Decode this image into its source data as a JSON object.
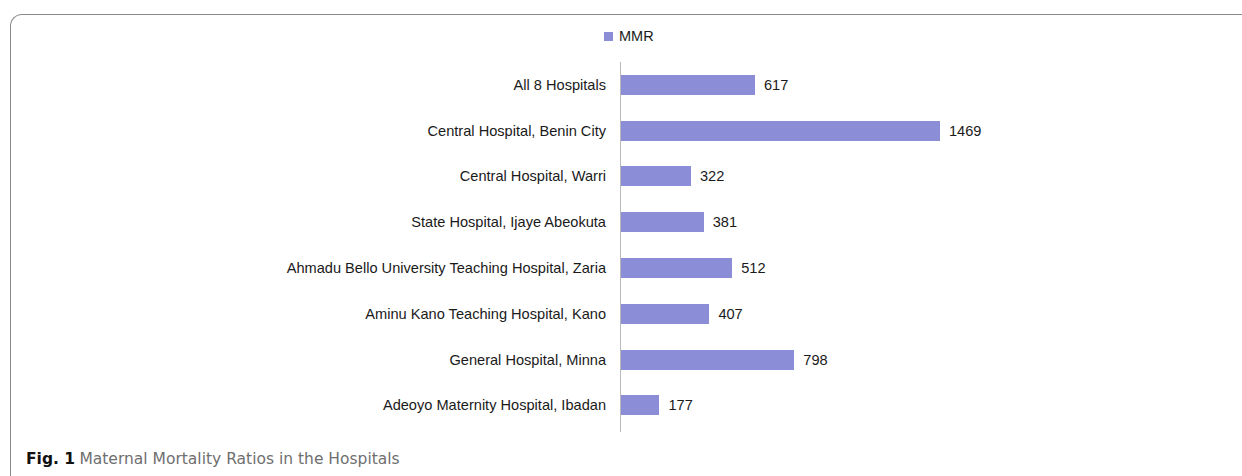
{
  "figure": {
    "caption_prefix": "Fig. 1",
    "caption_text": "Maternal Mortality Ratios in the Hospitals"
  },
  "legend": {
    "label": "MMR",
    "swatch_color": "#8b8ed6"
  },
  "chart_data": {
    "type": "bar",
    "orientation": "horizontal",
    "title": "Maternal Mortality Ratios in the Hospitals",
    "xlabel": "",
    "ylabel": "",
    "grid": false,
    "legend_position": "top-center",
    "legend_entries": [
      "MMR"
    ],
    "series_color": "#8b8ed6",
    "xlim": [
      0,
      1469
    ],
    "categories": [
      "All 8 Hospitals",
      "Central Hospital, Benin City",
      "Central Hospital, Warri",
      "State Hospital, Ijaye Abeokuta",
      "Ahmadu Bello University Teaching Hospital, Zaria",
      "Aminu Kano Teaching Hospital, Kano",
      "General Hospital, Minna",
      "Adeoyo Maternity Hospital, Ibadan"
    ],
    "series": [
      {
        "name": "MMR",
        "values": [
          617,
          1469,
          322,
          381,
          512,
          407,
          798,
          177
        ]
      }
    ],
    "data_labels": [
      "617",
      "1469",
      "322",
      "381",
      "512",
      "407",
      "798",
      "177"
    ]
  }
}
